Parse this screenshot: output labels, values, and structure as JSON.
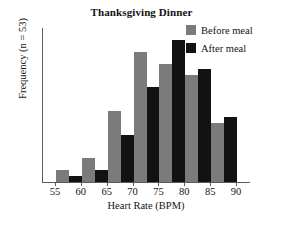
{
  "chart_data": {
    "type": "bar",
    "title": "Thanksgiving Dinner",
    "xlabel": "Heart Rate (BPM)",
    "ylabel": "Frequency (n = 53)",
    "categories": [
      "55",
      "60",
      "65",
      "70",
      "75",
      "80",
      "85"
    ],
    "bin_edges": [
      "55",
      "60",
      "65",
      "70",
      "75",
      "80",
      "85",
      "90"
    ],
    "xtick_labels": [
      "55",
      "60",
      "65",
      "70",
      "75",
      "80",
      "85",
      "90"
    ],
    "xlim": [
      52.5,
      92.5
    ],
    "ylim": [
      0,
      13
    ],
    "grid": false,
    "legend_position": "top-right",
    "series": [
      {
        "name": "Before meal",
        "color": "#7b7b7b",
        "values": [
          1,
          2,
          6,
          11,
          10,
          9,
          5
        ]
      },
      {
        "name": "After meal",
        "color": "#121212",
        "values": [
          0.5,
          1,
          4,
          8,
          12,
          9.5,
          5.5
        ]
      }
    ]
  },
  "legend": {
    "items": [
      {
        "label": "Before meal",
        "swatch": "before"
      },
      {
        "label": "After meal",
        "swatch": "after"
      }
    ]
  }
}
